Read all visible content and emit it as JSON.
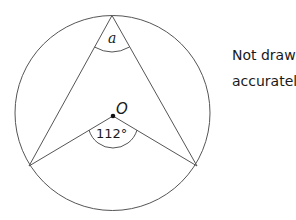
{
  "diagram": {
    "type": "circle-theorem",
    "circle": {
      "center_label": "O"
    },
    "angles": {
      "circumference_angle_label": "a",
      "center_angle_label": "112°"
    },
    "note": {
      "line1": "Not drawn",
      "line2": "accurately"
    },
    "colors": {
      "stroke": "#555555",
      "text": "#1a1a1a",
      "background": "#ffffff"
    }
  }
}
